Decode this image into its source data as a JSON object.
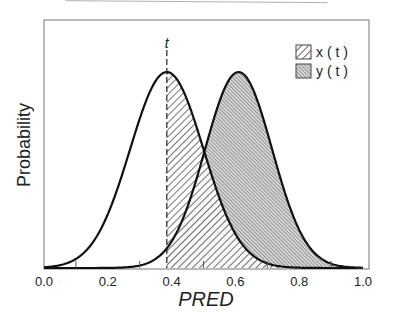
{
  "chart_data": {
    "type": "area",
    "title": "",
    "xlabel": "PRED",
    "ylabel": "Probability",
    "xlim": [
      0.0,
      1.0
    ],
    "xticks": [
      "0.0",
      "0.2",
      "0.4",
      "0.6",
      "0.8",
      "1.0"
    ],
    "minor_xticks": [
      0.1,
      0.3,
      0.5,
      0.7,
      0.9
    ],
    "grid": false,
    "legend_position": "upper right",
    "threshold": {
      "label": "t",
      "x": 0.385,
      "style": "dashed"
    },
    "series": [
      {
        "name": "x ( t )",
        "distribution": "normal",
        "mean": 0.385,
        "sd": 0.115,
        "fill": "hatch-backslash",
        "shaded_region": "x >= t"
      },
      {
        "name": "y ( t )",
        "distribution": "normal",
        "mean": 0.61,
        "sd": 0.105,
        "fill": "hatch-fine-slash",
        "shaded_region": "x >= t"
      }
    ]
  },
  "legend": {
    "items": [
      {
        "label": "x ( t )"
      },
      {
        "label": "y ( t )"
      }
    ]
  },
  "axes": {
    "xlabel": "PRED",
    "ylabel": "Probability",
    "threshold_label": "t",
    "ticks": [
      "0.0",
      "0.2",
      "0.4",
      "0.6",
      "0.8",
      "1.0"
    ]
  }
}
